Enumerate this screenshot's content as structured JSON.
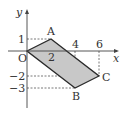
{
  "diagram": {
    "type": "coordinate-plane-quadrilateral",
    "axes": {
      "x_label": "x",
      "y_label": "y",
      "origin_label": "O",
      "x_ticks": [
        "2",
        "4",
        "6"
      ],
      "y_ticks": [
        "1",
        "−2",
        "−3"
      ]
    },
    "points": [
      {
        "label": "O",
        "x": 0,
        "y": 0
      },
      {
        "label": "A",
        "x": 2,
        "y": 1
      },
      {
        "label": "B",
        "x": 4,
        "y": -3
      },
      {
        "label": "C",
        "x": 6,
        "y": -2
      }
    ],
    "polygon": [
      "O",
      "A",
      "C",
      "B"
    ],
    "colors": {
      "fill": "#c8c8c8",
      "stroke": "#2a2a2a",
      "axis": "#444444",
      "dashed": "#555555"
    }
  }
}
